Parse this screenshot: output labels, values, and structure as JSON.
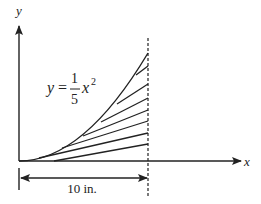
{
  "diagram": {
    "type": "math-figure",
    "axes": {
      "x_label": "x",
      "y_label": "y"
    },
    "equation": {
      "lhs": "y",
      "equals": "=",
      "numerator": "1",
      "denominator": "5",
      "variable": "x",
      "exponent": "2"
    },
    "dimension": {
      "label": "10 in."
    },
    "colors": {
      "stroke": "#222222",
      "background": "#ffffff"
    }
  }
}
